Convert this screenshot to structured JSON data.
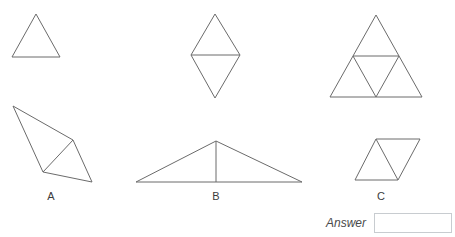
{
  "page": {
    "background_color": "#ffffff",
    "width": 455,
    "height": 237
  },
  "style": {
    "stroke_color": "#6b6b6b",
    "stroke_width": 1,
    "label_color": "#3c3c3c",
    "answer_label_color": "#4a4a4a",
    "input_border_color": "#c8ccd0"
  },
  "prompt_shapes": {
    "description": "Row of three reference figures showing 1, 2 and 4 triangles",
    "items": [
      {
        "id": "prompt-shape-1",
        "name": "single-triangle",
        "triangle_count": 1,
        "outline": "12,57 36,14 60,57",
        "internal_lines": []
      },
      {
        "id": "prompt-shape-2",
        "name": "rhombus-two-triangles",
        "triangle_count": 2,
        "outline": "215,14 240,55 215,98 191,55",
        "internal_lines": [
          "191,55 240,55"
        ]
      },
      {
        "id": "prompt-shape-3",
        "name": "large-triangle-four-triangles",
        "triangle_count": 4,
        "outline": "376,15 422,97 330,97",
        "internal_lines": [
          "353,56 399,56",
          "353,56 376,97",
          "399,56 376,97"
        ]
      }
    ]
  },
  "options": {
    "items": [
      {
        "id": "option-a",
        "label": "A",
        "name": "quadrilateral-with-diagonal",
        "label_x": 39,
        "label_y": 190,
        "outline": "13,106 73,140 92,182 43,172",
        "internal_lines": [
          "43,172 73,140"
        ]
      },
      {
        "id": "option-b",
        "label": "B",
        "name": "wide-triangle-with-altitude",
        "label_x": 204,
        "label_y": 190,
        "outline": "216,141 302,182 136,182",
        "internal_lines": [
          "216,141 216,182"
        ]
      },
      {
        "id": "option-c",
        "label": "C",
        "name": "parallelogram-with-diagonal",
        "label_x": 369,
        "label_y": 190,
        "outline": "376,139 420,139 398,180 355,180",
        "internal_lines": [
          "376,139 398,180"
        ]
      }
    ]
  },
  "answer": {
    "label": "Answer",
    "value": "",
    "placeholder": ""
  }
}
